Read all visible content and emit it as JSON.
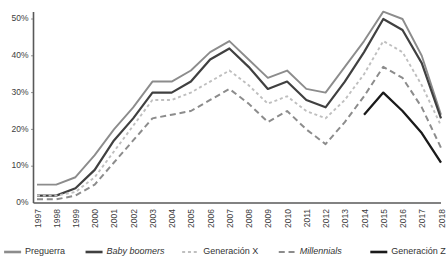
{
  "chart_data": {
    "type": "line",
    "title": "",
    "xlabel": "",
    "ylabel": "",
    "ylim": [
      0,
      55
    ],
    "xlim": [
      1997,
      2018
    ],
    "grid": false,
    "legend_position": "bottom",
    "ytick_labels": [
      "0%",
      "10%",
      "20%",
      "30%",
      "40%",
      "50%"
    ],
    "ytick_values": [
      0,
      10,
      20,
      30,
      40,
      50
    ],
    "x": [
      1997,
      1998,
      1999,
      2000,
      2001,
      2002,
      2003,
      2004,
      2005,
      2006,
      2007,
      2008,
      2009,
      2010,
      2011,
      2012,
      2013,
      2014,
      2015,
      2016,
      2017,
      2018
    ],
    "categories": [
      "1997",
      "1998",
      "1999",
      "2000",
      "2001",
      "2002",
      "2003",
      "2004",
      "2005",
      "2006",
      "2007",
      "2008",
      "2009",
      "2010",
      "2011",
      "2012",
      "2013",
      "2014",
      "2015",
      "2016",
      "2017",
      "2018"
    ],
    "series": [
      {
        "name": "Preguerra",
        "style": "solid",
        "color": "#8c8c8c",
        "width": 1.9,
        "italic": false,
        "values": [
          5,
          5,
          7,
          13,
          20,
          26,
          33,
          33,
          36,
          41,
          44,
          39,
          34,
          36,
          31,
          30,
          37,
          44,
          52,
          50,
          40,
          24
        ]
      },
      {
        "name": "Baby boomers",
        "style": "solid",
        "color": "#404040",
        "width": 2.2,
        "italic": true,
        "values": [
          2,
          2,
          4,
          9,
          17,
          23,
          30,
          30,
          33,
          39,
          42,
          37,
          31,
          33,
          28,
          26,
          33,
          41,
          50,
          47,
          38,
          23
        ]
      },
      {
        "name": "Generación X",
        "style": "dotted",
        "color": "#bfbfbf",
        "width": 1.9,
        "italic": false,
        "values": [
          2,
          2,
          3,
          7,
          14,
          21,
          28,
          28,
          30,
          33,
          36,
          32,
          27,
          29,
          25,
          23,
          28,
          35,
          44,
          41,
          32,
          21
        ]
      },
      {
        "name": "Millennials",
        "style": "dashed",
        "color": "#8c8c8c",
        "width": 2.0,
        "italic": true,
        "values": [
          1,
          1,
          2,
          5,
          11,
          17,
          23,
          24,
          25,
          28,
          31,
          27,
          22,
          25,
          20,
          16,
          22,
          29,
          37,
          34,
          26,
          15
        ]
      },
      {
        "name": "Generación Z",
        "style": "solid",
        "color": "#1a1a1a",
        "width": 2.3,
        "italic": false,
        "start_index": 17,
        "values": [
          null,
          null,
          null,
          null,
          null,
          null,
          null,
          null,
          null,
          null,
          null,
          null,
          null,
          null,
          null,
          null,
          null,
          24,
          30,
          25,
          19,
          11
        ]
      }
    ],
    "legend": [
      {
        "label": "Preguerra",
        "style": "solid",
        "color": "#8c8c8c",
        "italic": false
      },
      {
        "label": "Baby boomers",
        "style": "solid",
        "color": "#404040",
        "italic": true
      },
      {
        "label": "Generación X",
        "style": "dotted",
        "color": "#bfbfbf",
        "italic": false
      },
      {
        "label": "Millennials",
        "style": "dashed",
        "color": "#8c8c8c",
        "italic": true
      },
      {
        "label": "Generación Z",
        "style": "solid",
        "color": "#1a1a1a",
        "italic": false
      }
    ]
  }
}
